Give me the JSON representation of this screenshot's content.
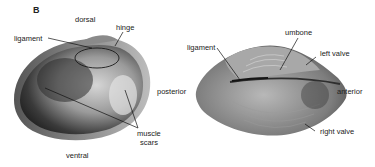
{
  "figure": {
    "panel_label": "B",
    "left_view": {
      "title": "Interior view of single valve",
      "labels": {
        "dorsal": "dorsal",
        "hinge": "hinge",
        "ligament": "ligament",
        "posterior": "posterior",
        "muscle_scars_line1": "muscle",
        "muscle_scars_line2": "scars",
        "ventral": "ventral"
      }
    },
    "right_view": {
      "title": "Dorsal view of closed shell",
      "labels": {
        "ligament": "ligament",
        "umbone": "umbone",
        "left_valve": "left valve",
        "anterior": "anterior",
        "right_valve": "right valve"
      }
    },
    "colors": {
      "background": "#ffffff",
      "text": "#222222",
      "shell_dark": "#2a2a2a",
      "shell_mid": "#7a7a7a",
      "shell_light": "#c8c8c8"
    }
  }
}
